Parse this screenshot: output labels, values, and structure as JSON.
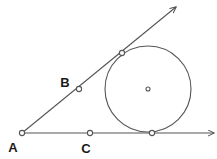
{
  "figure": {
    "background_color": "#ffffff",
    "stroke_color": "#555555",
    "label_color": "#1a1a1a",
    "width": 217,
    "height": 159
  },
  "labels": {
    "a": "A",
    "b": "B",
    "c": "C"
  },
  "chart_data": {
    "type": "scatter",
    "xlabel": "",
    "ylabel": "",
    "xlim": [
      0,
      217
    ],
    "ylim": [
      0,
      159
    ],
    "grid": false,
    "legend": false,
    "points": [
      {
        "name": "A",
        "label": "A",
        "x": 22,
        "y": 133,
        "marker": "open-circle",
        "label_dx": -9,
        "label_dy": 19
      },
      {
        "name": "B",
        "label": "B",
        "x": 79,
        "y": 89,
        "marker": "open-circle",
        "label_dx": -14,
        "label_dy": -2
      },
      {
        "name": "C",
        "label": "C",
        "x": 90,
        "y": 133,
        "marker": "open-circle",
        "label_dx": -4,
        "label_dy": 20
      },
      {
        "name": "tangent-upper",
        "label": "",
        "x": 122,
        "y": 53,
        "marker": "open-circle",
        "label_dx": 0,
        "label_dy": 0
      },
      {
        "name": "tangent-lower",
        "label": "",
        "x": 152,
        "y": 133,
        "marker": "open-circle",
        "label_dx": 0,
        "label_dy": 0
      },
      {
        "name": "center",
        "label": "",
        "x": 148,
        "y": 89,
        "marker": "open-circle-small",
        "label_dx": 0,
        "label_dy": 0
      }
    ],
    "circle": {
      "cx": 148,
      "cy": 89,
      "r": 43
    },
    "rays": [
      {
        "name": "ray-upper",
        "x1": 22,
        "y1": 133,
        "x2": 176,
        "y2": 7,
        "arrow": true
      },
      {
        "name": "ray-horizontal",
        "x1": 22,
        "y1": 133,
        "x2": 214,
        "y2": 133,
        "arrow": true
      }
    ]
  }
}
